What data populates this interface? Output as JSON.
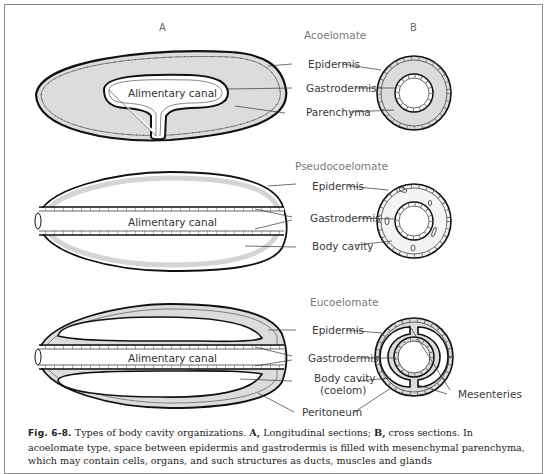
{
  "figure": {
    "column_labels": {
      "longitudinal": "A",
      "cross": "B"
    },
    "panels": [
      {
        "id": "acoelomate",
        "title": "Acoelomate",
        "canal_label": "Alimentary canal",
        "labels": [
          "Epidermis",
          "Gastrodermis",
          "Parenchyma"
        ]
      },
      {
        "id": "pseudocoelomate",
        "title": "Pseudocoelomate",
        "canal_label": "Alimentary canal",
        "labels": [
          "Epidermis",
          "Gastrodermis",
          "Body cavity"
        ]
      },
      {
        "id": "eucoelomate",
        "title": "Eucoelomate",
        "canal_label": "Alimentary canal",
        "labels": [
          "Epidermis",
          "Gastrodermis",
          "Body cavity",
          "(coelom)",
          "Peritoneum",
          "Mesenteries"
        ]
      }
    ],
    "colors": {
      "tissue_fill": "#dcdcdc",
      "outline": "#111111",
      "frame": "#8a8a8a",
      "title_text": "#7a7a7a"
    }
  },
  "caption": {
    "fig_number": "Fig. 6-8.",
    "line1_text": " Types of body cavity organizations. ",
    "a_label": "A,",
    "a_text": " Longitudinal sections; ",
    "b_label": "B,",
    "b_text": " cross sections. In",
    "line2": "acoelomate type, space between epidermis and gastrodermis is filled with mesenchymal parenchyma,",
    "line3": "which may contain cells, organs, and such structures as ducts, muscles and glands"
  }
}
